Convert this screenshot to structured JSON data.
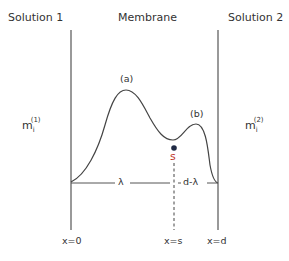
{
  "regions": {
    "left": "Solution 1",
    "middle": "Membrane",
    "right": "Solution 2"
  },
  "concentrations": {
    "left": {
      "base": "m",
      "sub": "i",
      "sup": "(1)"
    },
    "right": {
      "base": "m",
      "sub": "i",
      "sup": "(2)"
    }
  },
  "peaks": {
    "a": "(a)",
    "b": "(b)"
  },
  "site": {
    "label": "s",
    "color": "#c0392b",
    "dot_color": "#1f2a44"
  },
  "distances": {
    "lambda": "λ",
    "d_minus_lambda": "d-λ"
  },
  "positions": {
    "x0": "x=0",
    "xs": "x=s",
    "xd": "x=d"
  },
  "colors": {
    "line": "#444444"
  }
}
